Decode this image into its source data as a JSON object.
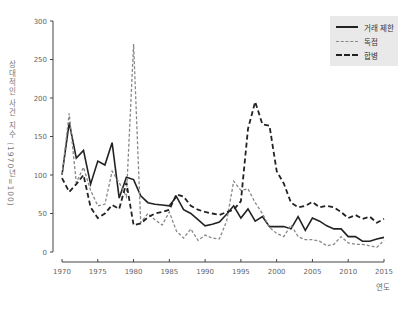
{
  "chart_data": {
    "type": "line",
    "title": "",
    "xlabel": "연도",
    "ylabel": "상대적인 사건 지수 (1970년=100)",
    "xlim": [
      1970,
      2015
    ],
    "ylim": [
      0,
      300
    ],
    "x_ticks": [
      1970,
      1975,
      1980,
      1985,
      1990,
      1995,
      2000,
      2005,
      2010,
      2015
    ],
    "y_ticks": [
      0,
      50,
      100,
      150,
      200,
      250,
      300
    ],
    "grid": false,
    "legend_position": "upper right",
    "x": [
      1970,
      1971,
      1972,
      1973,
      1974,
      1975,
      1976,
      1977,
      1978,
      1979,
      1980,
      1981,
      1982,
      1983,
      1984,
      1985,
      1986,
      1987,
      1988,
      1989,
      1990,
      1991,
      1992,
      1993,
      1994,
      1995,
      1996,
      1997,
      1998,
      1999,
      2000,
      2001,
      2002,
      2003,
      2004,
      2005,
      2006,
      2007,
      2008,
      2009,
      2010,
      2011,
      2012,
      2013,
      2014,
      2015
    ],
    "series": [
      {
        "name": "거래 제한",
        "style": "solid",
        "color": "#222222",
        "values": [
          100,
          168,
          122,
          132,
          88,
          118,
          113,
          142,
          70,
          97,
          94,
          73,
          64,
          62,
          61,
          60,
          72,
          55,
          50,
          42,
          34,
          36,
          39,
          49,
          60,
          44,
          56,
          40,
          46,
          33,
          33,
          33,
          30,
          46,
          28,
          44,
          40,
          34,
          30,
          30,
          20,
          20,
          14,
          14,
          17,
          19
        ]
      },
      {
        "name": "독점",
        "style": "dashed-light",
        "color": "#888888",
        "values": [
          100,
          180,
          90,
          110,
          80,
          60,
          62,
          105,
          90,
          72,
          270,
          38,
          50,
          42,
          35,
          52,
          27,
          18,
          30,
          15,
          22,
          18,
          17,
          40,
          92,
          80,
          82,
          64,
          50,
          32,
          24,
          20,
          35,
          20,
          16,
          16,
          14,
          8,
          10,
          20,
          12,
          10,
          10,
          8,
          6,
          15
        ]
      },
      {
        "name": "합병",
        "style": "dashed-heavy",
        "color": "#222222",
        "values": [
          96,
          78,
          88,
          100,
          58,
          44,
          50,
          61,
          56,
          90,
          35,
          37,
          45,
          50,
          52,
          55,
          75,
          72,
          60,
          55,
          52,
          50,
          48,
          52,
          55,
          66,
          160,
          195,
          166,
          164,
          105,
          89,
          64,
          58,
          60,
          65,
          58,
          60,
          58,
          52,
          44,
          48,
          43,
          46,
          38,
          43
        ]
      }
    ]
  },
  "legend": {
    "items": [
      {
        "label": "거래 제한"
      },
      {
        "label": "독점"
      },
      {
        "label": "합병"
      }
    ]
  },
  "axes": {
    "ylabel": "상대적인 사건 지수 (1970년=100)",
    "xlabel": "연도"
  }
}
